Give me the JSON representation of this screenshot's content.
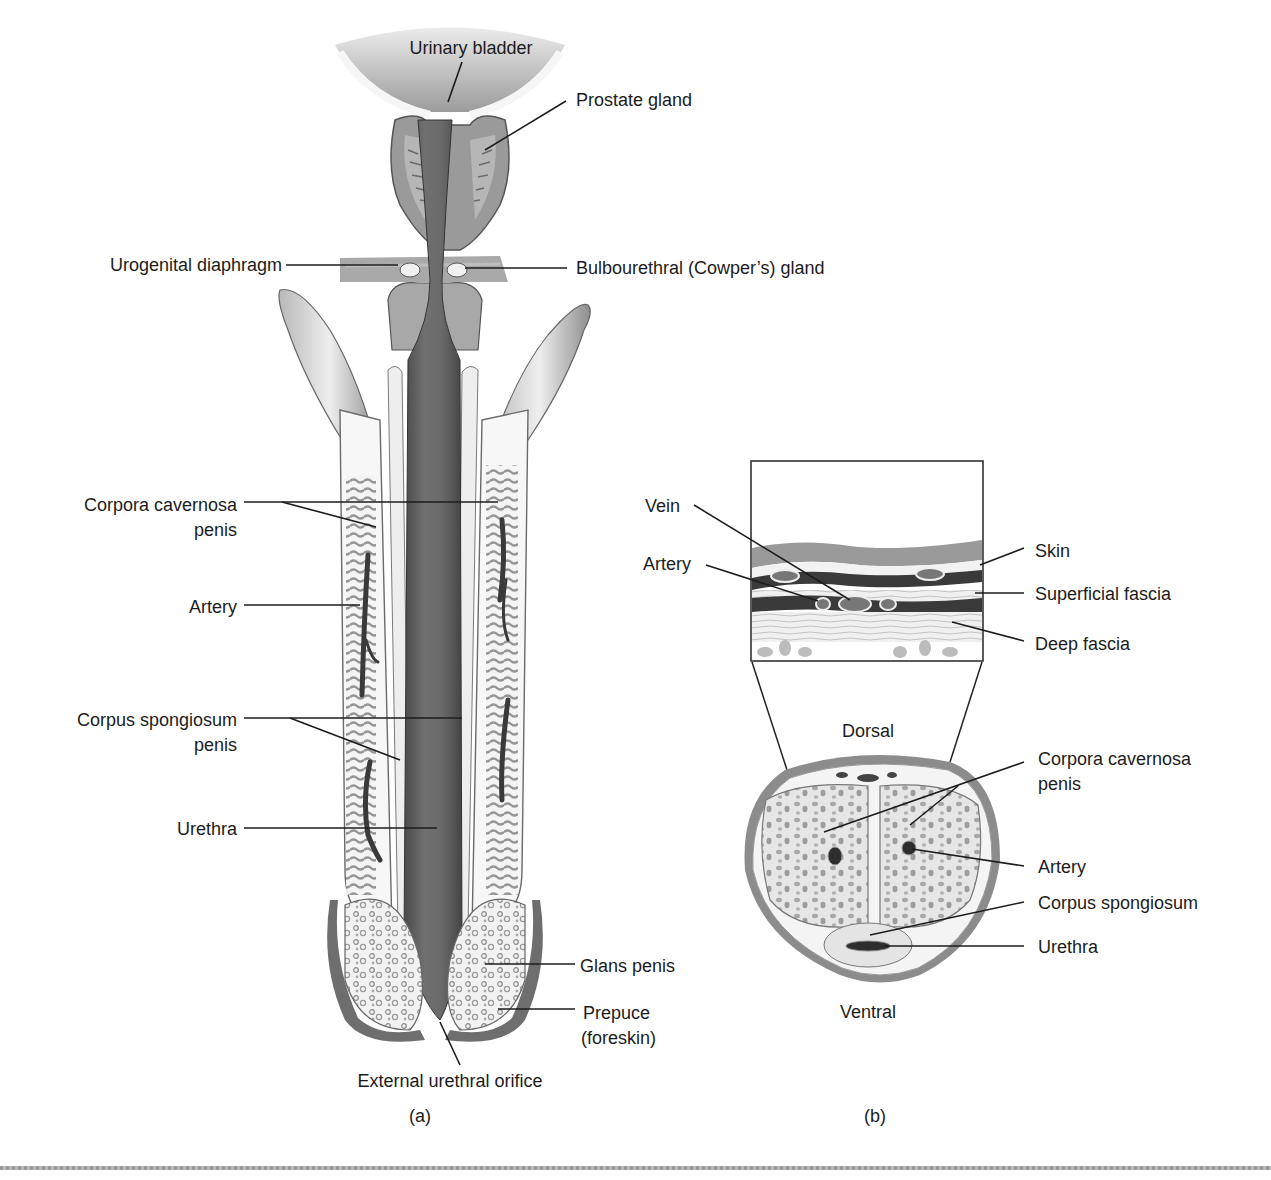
{
  "figure": {
    "panel_a": {
      "caption": "(a)",
      "labels": {
        "urinary_bladder": "Urinary bladder",
        "prostate_gland": "Prostate gland",
        "urogenital_diaphragm": "Urogenital diaphragm",
        "bulbourethral_gland": "Bulbourethral (Cowper’s) gland",
        "corpora_cavernosa_line1": "Corpora cavernosa",
        "corpora_cavernosa_line2": "penis",
        "artery": "Artery",
        "corpus_spongiosum_line1": "Corpus spongiosum",
        "corpus_spongiosum_line2": "penis",
        "urethra": "Urethra",
        "glans_penis": "Glans penis",
        "prepuce_line1": "Prepuce",
        "prepuce_line2": "(foreskin)",
        "external_urethral_orifice": "External urethral orifice"
      }
    },
    "panel_b": {
      "caption": "(b)",
      "inset_labels": {
        "vein": "Vein",
        "artery": "Artery",
        "skin": "Skin",
        "superficial_fascia": "Superficial fascia",
        "deep_fascia": "Deep fascia"
      },
      "cross_section_labels": {
        "dorsal": "Dorsal",
        "ventral": "Ventral",
        "corpora_cavernosa_line1": "Corpora cavernosa",
        "corpora_cavernosa_line2": "penis",
        "artery": "Artery",
        "corpus_spongiosum": "Corpus spongiosum",
        "urethra": "Urethra"
      }
    },
    "colors": {
      "ink": "#1c1c1c",
      "tissue_dark": "#5a5a5a",
      "tissue_mid": "#9a9a9a",
      "tissue_light": "#d6d6d6",
      "background": "#ffffff"
    }
  }
}
